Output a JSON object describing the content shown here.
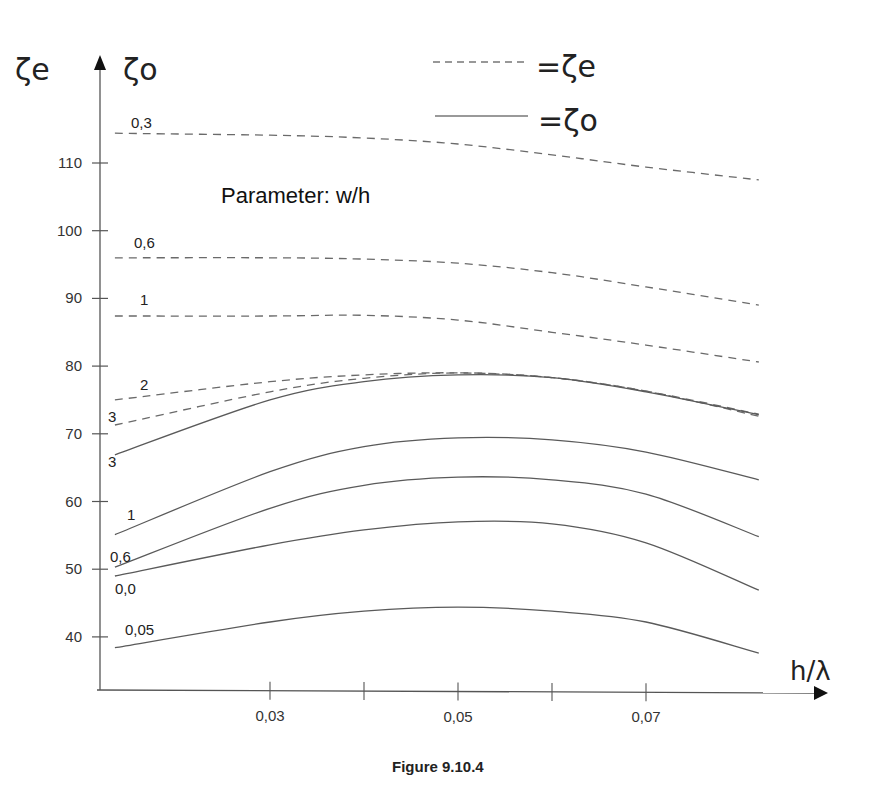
{
  "figure": {
    "caption": "Figure 9.10.4",
    "parameter_label": "Parameter: w/h",
    "legend": [
      {
        "style": "dashed",
        "label": "=ζe"
      },
      {
        "style": "solid",
        "label": "=ζo"
      }
    ],
    "y_axis_symbols": {
      "left": "ζe",
      "right": "ζo"
    },
    "x_axis_symbol": "h/λ"
  },
  "chart_data": {
    "type": "line",
    "title": "Figure 9.10.4",
    "subtitle": "Parameter: w/h",
    "xlabel": "h/λ",
    "ylabel": "ζe, ζo",
    "xlim": [
      0.0117,
      0.085
    ],
    "ylim": [
      32,
      122
    ],
    "grid": false,
    "legend_position": "top-right",
    "x_ticks": [
      0.03,
      0.04,
      0.05,
      0.06,
      0.07
    ],
    "x_tick_labels": [
      "0,03",
      "",
      "0,05",
      "",
      "0,07"
    ],
    "y_ticks": [
      40,
      50,
      60,
      70,
      80,
      90,
      100,
      110
    ],
    "y_tick_labels": [
      "40",
      "50",
      "60",
      "70",
      "80",
      "90",
      "100",
      "110"
    ],
    "x": [
      0.0135,
      0.03,
      0.04,
      0.05,
      0.06,
      0.07,
      0.082
    ],
    "series": [
      {
        "name": "ζe w/h=0,3",
        "label": "0,3",
        "style": "dashed",
        "values": [
          114.4,
          114.1,
          113.7,
          112.8,
          111.2,
          109.4,
          107.5
        ]
      },
      {
        "name": "ζe w/h=0,6",
        "label": "0,6",
        "style": "dashed",
        "values": [
          96.0,
          96.0,
          95.8,
          95.2,
          93.8,
          91.7,
          89.0
        ]
      },
      {
        "name": "ζe w/h=1",
        "label": "1",
        "style": "dashed",
        "values": [
          87.4,
          87.4,
          87.5,
          86.8,
          85.0,
          83.1,
          80.6
        ]
      },
      {
        "name": "ζe w/h=2",
        "label": "2",
        "style": "dashed",
        "values": [
          75.0,
          77.7,
          78.7,
          79.0,
          78.3,
          76.3,
          72.9
        ]
      },
      {
        "name": "ζe w/h=3",
        "label": "3",
        "style": "dashed",
        "values": [
          71.3,
          76.2,
          78.2,
          79.0,
          78.3,
          76.3,
          72.6
        ]
      },
      {
        "name": "ζo w/h=3",
        "label": "3",
        "style": "solid",
        "values": [
          66.9,
          75.0,
          77.7,
          78.7,
          78.3,
          76.2,
          72.8
        ]
      },
      {
        "name": "ζo w/h=1",
        "label": "1",
        "style": "solid",
        "values": [
          55.1,
          64.4,
          68.1,
          69.4,
          69.1,
          67.3,
          63.2
        ]
      },
      {
        "name": "ζo w/h=0,6",
        "label": "0,6",
        "style": "solid",
        "values": [
          50.3,
          59.0,
          62.4,
          63.6,
          63.2,
          61.1,
          54.8
        ]
      },
      {
        "name": "ζo w/h=0,3",
        "label": "0,3",
        "style": "solid",
        "values": [
          49.0,
          53.6,
          55.8,
          57.0,
          56.7,
          53.9,
          46.9
        ]
      },
      {
        "name": "ζo w/h=0,05",
        "label": "0,05",
        "style": "solid",
        "values": [
          38.4,
          42.2,
          43.8,
          44.4,
          43.8,
          42.2,
          37.6
        ]
      }
    ],
    "curve_label_positions": [
      {
        "text": "0,3",
        "px": 131,
        "py": 128
      },
      {
        "text": "0,6",
        "px": 134,
        "py": 248
      },
      {
        "text": "1",
        "px": 140,
        "py": 305
      },
      {
        "text": "2",
        "px": 140,
        "py": 390
      },
      {
        "text": "3",
        "px": 108,
        "py": 422
      },
      {
        "text": "3",
        "px": 108,
        "py": 467
      },
      {
        "text": "1",
        "px": 127,
        "py": 520
      },
      {
        "text": "0,6",
        "px": 110,
        "py": 562
      },
      {
        "text": "0,0",
        "px": 115,
        "py": 594
      },
      {
        "text": "0,05",
        "px": 125,
        "py": 635
      }
    ]
  }
}
